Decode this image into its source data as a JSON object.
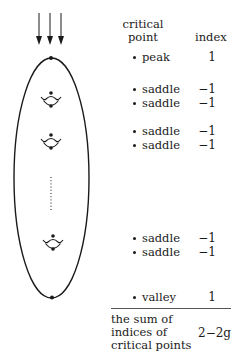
{
  "table": {
    "header": {
      "col1_line1": "critical",
      "col1_line2": "point",
      "col2": "index"
    },
    "rows": [
      {
        "label": "peak",
        "index": "1"
      },
      {
        "label": "saddle",
        "index": "−1"
      },
      {
        "label": "saddle",
        "index": "−1"
      },
      {
        "label": "saddle",
        "index": "−1"
      },
      {
        "label": "saddle",
        "index": "−1"
      },
      {
        "label": "saddle",
        "index": "−1"
      },
      {
        "label": "saddle",
        "index": "−1"
      },
      {
        "label": "valley",
        "index": "1"
      }
    ],
    "footer": {
      "line1": "the sum of",
      "line2": "indices of",
      "line3": "critical points",
      "value": "2−2g"
    }
  },
  "figure": {
    "flow_arrows": 3,
    "holes": 3,
    "ellipsis": "vertical dotted line"
  }
}
